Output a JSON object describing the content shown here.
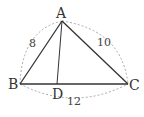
{
  "diagram": {
    "type": "triangle",
    "points": {
      "A": {
        "label": "A"
      },
      "B": {
        "label": "B"
      },
      "C": {
        "label": "C"
      },
      "D": {
        "label": "D"
      }
    },
    "sides": {
      "AB": "8",
      "AC": "10",
      "BC": "12"
    },
    "segments": [
      "AB",
      "AC",
      "BC",
      "AD"
    ],
    "colors": {
      "line": "#333333",
      "dashed_arc": "#aaaaaa"
    }
  }
}
